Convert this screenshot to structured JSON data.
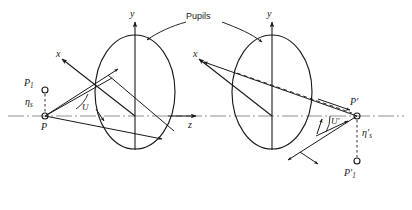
{
  "figure": {
    "caption_label": "Pupils",
    "background_color": "#ffffff",
    "ink_color": "#1a1a1a",
    "axis_color": "#8a8a8a",
    "width": 412,
    "height": 210
  },
  "labels": {
    "pupils": "Pupils",
    "y_left": "y",
    "y_right": "y",
    "x_left": "x",
    "x_right": "x",
    "z_axis": "z",
    "object_point": "P",
    "object_point_aux": "P",
    "object_point_aux_sub": "1",
    "object_height": "η",
    "object_height_sub": "s",
    "image_point": "P′",
    "image_point_aux": "P′",
    "image_point_aux_sub": "1",
    "image_height": "η′",
    "image_height_sub": "s",
    "angle_u": "U",
    "angle_u_prime": "U′"
  },
  "diagram_data": {
    "type": "optical-ray-diagram",
    "description": "Entrance and exit pupil ray diagram showing object point P imaged to P-prime through two pupil ellipses on the z axis",
    "elements": [
      {
        "name": "entrance-pupil-ellipse",
        "cx": 135,
        "cy": 92,
        "rx": 40,
        "ry": 57
      },
      {
        "name": "exit-pupil-ellipse",
        "cx": 272,
        "cy": 92,
        "rx": 40,
        "ry": 57
      },
      {
        "name": "optical-axis",
        "y": 116,
        "x_start": 8,
        "x_end": 404,
        "style": "dash-dot"
      },
      {
        "name": "object-point",
        "x": 45,
        "y": 116
      },
      {
        "name": "image-point",
        "x": 357,
        "y": 116
      },
      {
        "name": "object-aux-point",
        "x": 45,
        "y": 92
      },
      {
        "name": "image-aux-point",
        "x": 357,
        "y": 148
      }
    ]
  }
}
